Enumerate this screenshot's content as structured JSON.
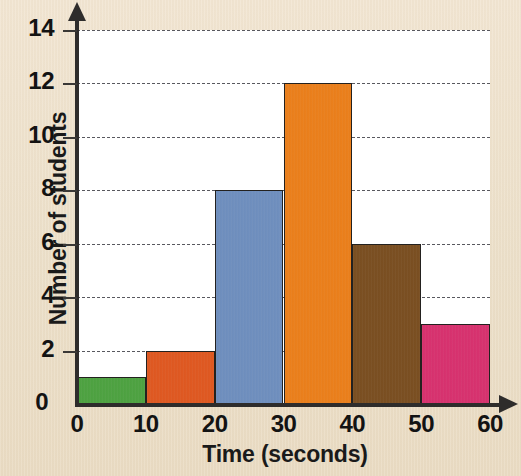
{
  "chart_data": {
    "type": "bar",
    "title": "",
    "xlabel": "Time (seconds)",
    "ylabel": "Number of students",
    "categories": [
      "0-10",
      "10-20",
      "20-30",
      "30-40",
      "40-50",
      "50-60"
    ],
    "values": [
      1,
      2,
      8,
      12,
      6,
      3
    ],
    "bin_edges": [
      0,
      10,
      20,
      30,
      40,
      50,
      60
    ],
    "bar_colors": [
      "#4ca33f",
      "#e2571e",
      "#6e8fc0",
      "#ee7f18",
      "#7a4d1e",
      "#da2f6e"
    ],
    "xlim": [
      0,
      60
    ],
    "ylim": [
      0,
      14
    ],
    "xticks": [
      "0",
      "10",
      "20",
      "30",
      "40",
      "50",
      "60"
    ],
    "yticks": [
      "0",
      "2",
      "4",
      "6",
      "8",
      "10",
      "12",
      "14"
    ],
    "grid": "horizontal-dashed",
    "legend": "none",
    "plot_background": "#ffffff",
    "page_background": "#efe2cd"
  }
}
